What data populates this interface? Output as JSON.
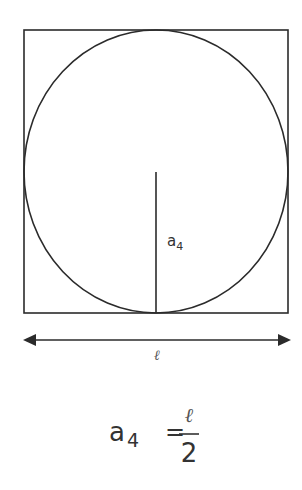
{
  "diagram": {
    "colors": {
      "stroke": "#2b2b2b",
      "text": "#333333",
      "background": "#ffffff"
    },
    "square": {
      "x": 24,
      "y": 30,
      "width": 264,
      "height": 283
    },
    "circle": {
      "cx": 156,
      "cy": 171.5,
      "rx": 132,
      "ry": 141.5
    },
    "radius_line": {
      "x": 156,
      "y1": 172,
      "y2": 313
    },
    "radius_label": {
      "base": "a",
      "subscript": "4"
    },
    "dimension_arrow": {
      "x1": 23,
      "x2": 291,
      "y": 340,
      "label": "ℓ"
    },
    "formula": {
      "lhs_base": "a",
      "lhs_subscript": "4",
      "equals": "=",
      "numerator": "ℓ",
      "denominator": "2"
    }
  }
}
